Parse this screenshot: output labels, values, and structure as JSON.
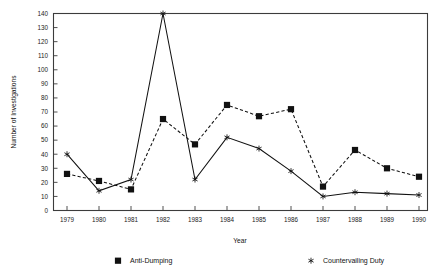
{
  "chart_data": {
    "type": "line",
    "title": "",
    "xlabel": "Year",
    "ylabel": "Number of Investigations",
    "categories": [
      "1979",
      "1980",
      "1981",
      "1982",
      "1983",
      "1984",
      "1985",
      "1986",
      "1987",
      "1988",
      "1989",
      "1990"
    ],
    "x": [
      1979,
      1980,
      1981,
      1982,
      1983,
      1984,
      1985,
      1986,
      1987,
      1988,
      1989,
      1990
    ],
    "xlim": [
      1978.5,
      1990.6
    ],
    "ylim": [
      0,
      140
    ],
    "yticks": [
      0,
      10,
      20,
      30,
      40,
      50,
      60,
      70,
      80,
      90,
      100,
      110,
      120,
      130,
      140
    ],
    "ytick_labels": [
      "0",
      "10",
      "20",
      "30",
      "40",
      "50",
      "60",
      "70",
      "80",
      "90",
      "100",
      "110",
      "120",
      "130",
      "140"
    ],
    "grid": false,
    "legend_position": "bottom",
    "series": [
      {
        "name": "Anti-Dumping",
        "marker": "filled-square",
        "line_style": "dashed",
        "color": "#111111",
        "values": [
          26,
          21,
          15,
          65,
          47,
          75,
          67,
          72,
          17,
          43,
          30,
          24
        ]
      },
      {
        "name": "Countervailing Duty",
        "marker": "star",
        "line_style": "solid",
        "color": "#111111",
        "values": [
          40,
          14,
          22,
          140,
          22,
          52,
          44,
          28,
          10,
          13,
          12,
          11
        ]
      }
    ]
  },
  "legend": {
    "items": [
      {
        "label": "Anti-Dumping",
        "marker": "filled-square"
      },
      {
        "label": "Countervailing Duty",
        "marker": "star"
      }
    ]
  },
  "axes": {
    "x_title": "Year",
    "y_title": "Number of Investigations"
  }
}
